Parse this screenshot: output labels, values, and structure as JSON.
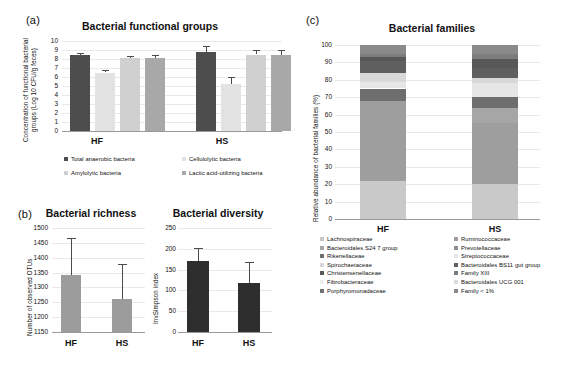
{
  "figure": {
    "background": "#ffffff"
  },
  "panel_a": {
    "letter": "(a)",
    "title": "Bacterial functional groups",
    "ylabel_line1": "Concentration of functional bacterial",
    "ylabel_line2": "groups (Log 10 CFU/g feces)",
    "yticks": [
      "10",
      "9",
      "8",
      "7",
      "6",
      "5",
      "4",
      "3",
      "2",
      "1",
      "0"
    ],
    "groups": [
      "HF",
      "HS"
    ],
    "legend": [
      {
        "label": "Total anaerobic bacteria",
        "color": "#4d4d4d"
      },
      {
        "label": "Cellulolytic bacteria",
        "color": "#e3e3e3"
      },
      {
        "label": "Amylolytic bacteria",
        "color": "#d0d0d0"
      },
      {
        "label": "Lactic acid-utilizing bacteria",
        "color": "#a8a8a8"
      }
    ]
  },
  "panel_b": {
    "letter": "(b)",
    "richness": {
      "title": "Bacterial richness",
      "ylabel": "Number of observed OTUs",
      "yticks": [
        "1500",
        "1450",
        "1400",
        "1350",
        "1300",
        "1250",
        "1200",
        "1150"
      ],
      "categories": [
        "HF",
        "HS"
      ]
    },
    "diversity": {
      "title": "Bacterial diversity",
      "ylabel": "InvSimpson index",
      "yticks": [
        "250",
        "200",
        "150",
        "100",
        "50",
        "0"
      ],
      "categories": [
        "HF",
        "HS"
      ]
    }
  },
  "panel_c": {
    "letter": "(c)",
    "title": "Bacterial families",
    "ylabel": "Relative abundance of bacterial families (%)",
    "yticks": [
      "100",
      "90",
      "80",
      "70",
      "60",
      "50",
      "40",
      "30",
      "20",
      "10",
      "0"
    ],
    "groups": [
      "HF",
      "HS"
    ],
    "legend_left": [
      {
        "label": "Lachnospiraceae",
        "color": "#c9c9c9"
      },
      {
        "label": "Bacteroidales S24 7 group",
        "color": "#a6a6a6"
      },
      {
        "label": "Rikenellaceae",
        "color": "#6e6e6e"
      },
      {
        "label": "Spirochaetaceae",
        "color": "#d8d8d8"
      },
      {
        "label": "Christensenellaceae",
        "color": "#585858"
      },
      {
        "label": "Fibrobacteraceae",
        "color": "#efefef"
      },
      {
        "label": "Porphyromonadaceae",
        "color": "#717171"
      }
    ],
    "legend_right": [
      {
        "label": "Ruminococcaceae",
        "color": "#9e9e9e"
      },
      {
        "label": "Prevotellaceae",
        "color": "#8f8f8f"
      },
      {
        "label": "Streptococcaceae",
        "color": "#e6e6e6"
      },
      {
        "label": "Bacteroidales BS11 gut group",
        "color": "#5f5f5f"
      },
      {
        "label": "Family XIII",
        "color": "#7d7d7d"
      },
      {
        "label": "Bacteroidales UCG 001",
        "color": "#dcdcdc"
      },
      {
        "label": "Family < 1%",
        "color": "#8a8a8a"
      }
    ]
  },
  "chart_data": [
    {
      "id": "panel-a",
      "type": "bar",
      "title": "Bacterial functional groups",
      "xlabel": "",
      "ylabel": "Concentration of functional bacterial groups (Log 10 CFU/g feces)",
      "ylim": [
        0,
        10
      ],
      "ytick_step": 1,
      "categories": [
        "HF",
        "HS"
      ],
      "series": [
        {
          "name": "Total anaerobic bacteria",
          "color": "#4d4d4d",
          "values": [
            8.4,
            8.75
          ],
          "errors": [
            0.25,
            0.75
          ]
        },
        {
          "name": "Cellulolytic bacteria",
          "color": "#e3e3e3",
          "values": [
            6.5,
            5.25
          ],
          "errors": [
            0.3,
            0.75
          ]
        },
        {
          "name": "Amylolytic bacteria",
          "color": "#d0d0d0",
          "values": [
            8.1,
            8.5
          ],
          "errors": [
            0.25,
            0.45
          ]
        },
        {
          "name": "Lactic acid-utilizing bacteria",
          "color": "#a8a8a8",
          "values": [
            8.1,
            8.45
          ],
          "errors": [
            0.3,
            0.5
          ]
        }
      ],
      "grid": true,
      "legend_position": "bottom"
    },
    {
      "id": "panel-b-richness",
      "type": "bar",
      "title": "Bacterial richness",
      "xlabel": "",
      "ylabel": "Number of observed OTUs",
      "ylim": [
        1150,
        1500
      ],
      "ytick_step": 50,
      "categories": [
        "HF",
        "HS"
      ],
      "values": [
        1342,
        1262
      ],
      "errors": [
        125,
        118
      ],
      "bar_color": "#9c9c9c",
      "grid": true,
      "legend_position": "none"
    },
    {
      "id": "panel-b-diversity",
      "type": "bar",
      "title": "Bacterial diversity",
      "xlabel": "",
      "ylabel": "InvSimpson index",
      "ylim": [
        0,
        250
      ],
      "ytick_step": 50,
      "categories": [
        "HF",
        "HS"
      ],
      "values": [
        170,
        117
      ],
      "errors": [
        31,
        52
      ],
      "bar_color": "#2e2e2e",
      "grid": true,
      "legend_position": "none"
    },
    {
      "id": "panel-c",
      "type": "bar",
      "subtype": "stacked-100",
      "title": "Bacterial families",
      "xlabel": "",
      "ylabel": "Relative abundance of bacterial families (%)",
      "ylim": [
        0,
        100
      ],
      "ytick_step": 10,
      "categories": [
        "HF",
        "HS"
      ],
      "series": [
        {
          "name": "Lachnospiraceae",
          "color": "#c9c9c9",
          "values": [
            22,
            20
          ]
        },
        {
          "name": "Ruminococcaceae",
          "color": "#9e9e9e",
          "values": [
            46,
            35
          ]
        },
        {
          "name": "Bacteroidales S24 7 group",
          "color": "#a6a6a6",
          "values": [
            0,
            9
          ]
        },
        {
          "name": "Prevotellaceae",
          "color": "#8f8f8f",
          "values": [
            0,
            0
          ]
        },
        {
          "name": "Rikenellaceae",
          "color": "#6e6e6e",
          "values": [
            7,
            6
          ]
        },
        {
          "name": "Streptococcaceae",
          "color": "#e6e6e6",
          "values": [
            4,
            8
          ]
        },
        {
          "name": "Spirochaetaceae",
          "color": "#d8d8d8",
          "values": [
            5,
            3
          ]
        },
        {
          "name": "Bacteroidales BS11 gut group",
          "color": "#5f5f5f",
          "values": [
            7,
            6
          ]
        },
        {
          "name": "Christensenellaceae",
          "color": "#585858",
          "values": [
            2,
            5
          ]
        },
        {
          "name": "Family XIII",
          "color": "#7d7d7d",
          "values": [
            2,
            3
          ]
        },
        {
          "name": "Fibrobacteraceae",
          "color": "#efefef",
          "values": [
            0,
            0
          ]
        },
        {
          "name": "Bacteroidales UCG 001",
          "color": "#dcdcdc",
          "values": [
            0,
            0
          ]
        },
        {
          "name": "Porphyromonadaceae",
          "color": "#717171",
          "values": [
            0,
            0
          ]
        },
        {
          "name": "Family < 1%",
          "color": "#8a8a8a",
          "values": [
            5,
            5
          ]
        }
      ],
      "grid": true,
      "legend_position": "bottom"
    }
  ]
}
